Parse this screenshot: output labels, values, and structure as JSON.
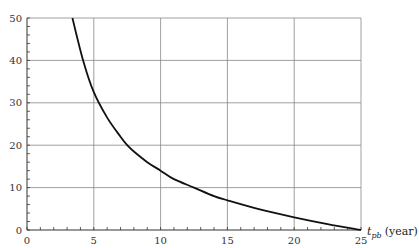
{
  "chart_data": {
    "type": "line",
    "title": "",
    "xlabel": "t_pb (year)",
    "xlabel_main": "t",
    "xlabel_sub": "pb",
    "xlabel_unit": "(year)",
    "ylabel": "",
    "xlim": [
      0,
      25
    ],
    "ylim": [
      0,
      50
    ],
    "x_ticks": [
      0,
      5,
      10,
      15,
      20,
      25
    ],
    "y_ticks": [
      0,
      10,
      20,
      30,
      40,
      50
    ],
    "x_minor_step": 1,
    "y_minor_step": 2,
    "grid": true,
    "legend": null,
    "series": [
      {
        "name": "curve",
        "color": "#111111",
        "x": [
          3.4,
          4.2,
          5,
          6,
          7,
          7.5,
          8,
          9,
          10,
          11,
          12.5,
          14,
          15,
          17.5,
          20,
          22.5,
          25
        ],
        "y": [
          50,
          40,
          32.5,
          26.5,
          22,
          20,
          18.5,
          16,
          14,
          12,
          10,
          8,
          7,
          4.8,
          3,
          1.4,
          0
        ]
      }
    ]
  },
  "colors": {
    "grid": "#888888",
    "axis": "#333333",
    "curve": "#111111"
  }
}
